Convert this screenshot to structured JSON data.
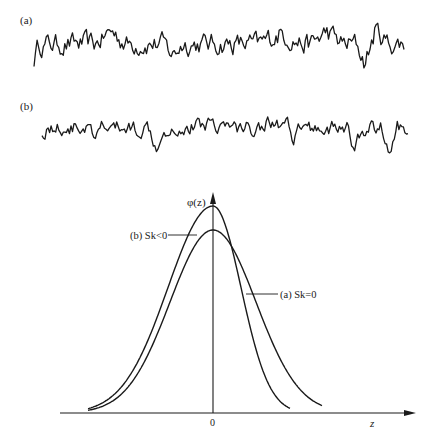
{
  "figure": {
    "panel_a_label": "(a)",
    "panel_b_label": "(b)",
    "y_axis_label": "φ(z)",
    "x_axis_label": "z",
    "origin_label": "0",
    "curve_b_label": "(b) Sk<0",
    "curve_a_label": "(a) Sk=0",
    "colors": {
      "ink": "#1a1a1a",
      "background": "#ffffff"
    }
  },
  "chart_data": [
    {
      "type": "line",
      "title": "(a) Random signal, symmetric distribution",
      "xlabel": "",
      "ylabel": "",
      "description": "Irregular fluctuating time series with roughly symmetric excursions above and below the mean",
      "grid": false
    },
    {
      "type": "line",
      "title": "(b) Random signal, negatively skewed",
      "xlabel": "",
      "ylabel": "",
      "description": "Irregular fluctuating time series with occasional large downward spikes (negative skewness)",
      "grid": false
    },
    {
      "type": "line",
      "title": "Probability density functions",
      "xlabel": "z",
      "ylabel": "φ(z)",
      "x_ticks": [
        "0"
      ],
      "grid": false,
      "series": [
        {
          "name": "(a) Sk=0",
          "shape": "symmetric Gaussian centered at 0",
          "relative_peak": 0.83
        },
        {
          "name": "(b) Sk<0",
          "shape": "negatively skewed, taller peak near 0, longer left tail, shorter right tail",
          "relative_peak": 0.94
        }
      ]
    }
  ]
}
